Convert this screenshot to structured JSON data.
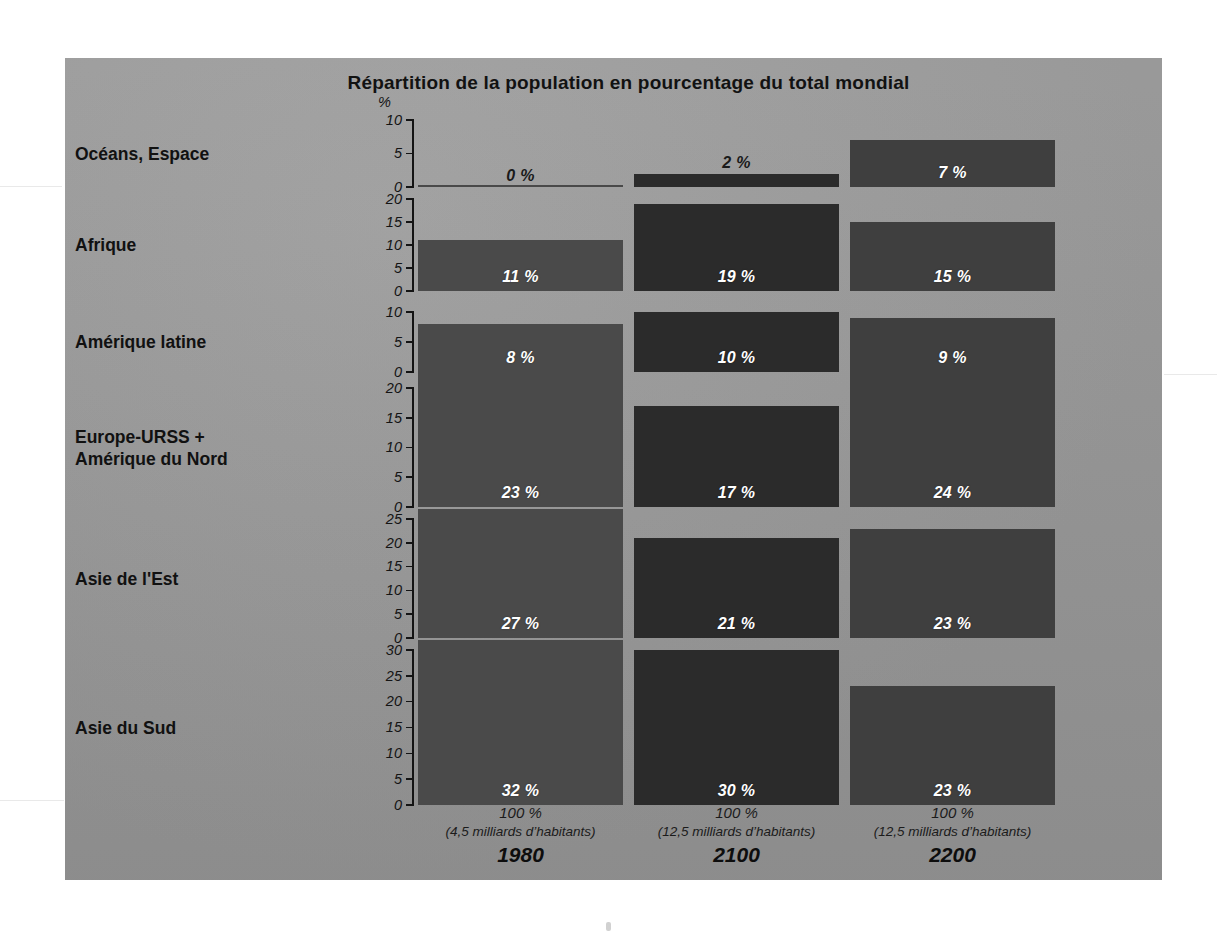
{
  "figure": {
    "title": "Répartition de la population en pourcentage du total mondial",
    "percent_symbol": "%",
    "background_color": "#9a9a9a",
    "label_color": "#ffffff"
  },
  "columns": [
    {
      "year": "1980",
      "total_pct": "100 %",
      "total_people": "(4,5 milliards d’habitants)",
      "color": "#4a4a4a"
    },
    {
      "year": "2100",
      "total_pct": "100 %",
      "total_people": "(12,5 milliards d’habitants)",
      "color": "#2b2b2b"
    },
    {
      "year": "2200",
      "total_pct": "100 %",
      "total_people": "(12,5 milliards d’habitants)",
      "color": "#3f3f3f"
    }
  ],
  "rows": [
    {
      "label": "Océans, Espace",
      "ymax": 10,
      "ticks": [
        "10",
        "5",
        "0"
      ],
      "values": [
        "0 %",
        "2 %",
        "7 %"
      ],
      "numbers": [
        0,
        2,
        7
      ]
    },
    {
      "label": "Afrique",
      "ymax": 20,
      "ticks": [
        "20",
        "15",
        "10",
        "5",
        "0"
      ],
      "values": [
        "11 %",
        "19 %",
        "15 %"
      ],
      "numbers": [
        11,
        19,
        15
      ]
    },
    {
      "label": "Amérique latine",
      "ymax": 10,
      "ticks": [
        "10",
        "5",
        "0"
      ],
      "values": [
        "8 %",
        "10 %",
        "9 %"
      ],
      "numbers": [
        8,
        10,
        9
      ]
    },
    {
      "label": "Europe-URSS +\nAmérique du Nord",
      "ymax": 20,
      "ticks": [
        "20",
        "15",
        "10",
        "5",
        "0"
      ],
      "values": [
        "23 %",
        "17 %",
        "24 %"
      ],
      "numbers": [
        23,
        17,
        24
      ]
    },
    {
      "label": "Asie de l'Est",
      "ymax": 25,
      "ticks": [
        "25",
        "20",
        "15",
        "10",
        "5",
        "0"
      ],
      "values": [
        "27 %",
        "21 %",
        "23 %"
      ],
      "numbers": [
        27,
        21,
        23
      ]
    },
    {
      "label": "Asie du Sud",
      "ymax": 30,
      "ticks": [
        "30",
        "25",
        "20",
        "15",
        "10",
        "5",
        "0"
      ],
      "values": [
        "32 %",
        "30 %",
        "23 %"
      ],
      "numbers": [
        32,
        30,
        23
      ]
    }
  ],
  "chart_data": {
    "type": "bar",
    "title": "Répartition de la population en pourcentage du total mondial",
    "xlabel": "",
    "ylabel": "%",
    "categories": [
      "1980",
      "2100",
      "2200"
    ],
    "grid": false,
    "legend": "none",
    "orientation": "vertical",
    "panels": [
      {
        "name": "Océans, Espace",
        "ylim": [
          0,
          10
        ],
        "yticks": [
          0,
          5,
          10
        ],
        "values": [
          0,
          2,
          7
        ],
        "data_labels": [
          "0 %",
          "2 %",
          "7 %"
        ]
      },
      {
        "name": "Afrique",
        "ylim": [
          0,
          20
        ],
        "yticks": [
          0,
          5,
          10,
          15,
          20
        ],
        "values": [
          11,
          19,
          15
        ],
        "data_labels": [
          "11 %",
          "19 %",
          "15 %"
        ]
      },
      {
        "name": "Amérique latine",
        "ylim": [
          0,
          10
        ],
        "yticks": [
          0,
          5,
          10
        ],
        "values": [
          8,
          10,
          9
        ],
        "data_labels": [
          "8 %",
          "10 %",
          "9 %"
        ]
      },
      {
        "name": "Europe-URSS + Amérique du Nord",
        "ylim": [
          0,
          20
        ],
        "yticks": [
          0,
          5,
          10,
          15,
          20
        ],
        "values": [
          23,
          17,
          24
        ],
        "data_labels": [
          "23 %",
          "17 %",
          "24 %"
        ]
      },
      {
        "name": "Asie de l'Est",
        "ylim": [
          0,
          25
        ],
        "yticks": [
          0,
          5,
          10,
          15,
          20,
          25
        ],
        "values": [
          27,
          21,
          23
        ],
        "data_labels": [
          "27 %",
          "21 %",
          "23 %"
        ]
      },
      {
        "name": "Asie du Sud",
        "ylim": [
          0,
          30
        ],
        "yticks": [
          0,
          5,
          10,
          15,
          20,
          25,
          30
        ],
        "values": [
          32,
          30,
          23
        ],
        "data_labels": [
          "32 %",
          "30 %",
          "23 %"
        ]
      }
    ],
    "column_annotations": [
      {
        "year": "1980",
        "total": "100 %",
        "population": "(4,5 milliards d’habitants)"
      },
      {
        "year": "2100",
        "total": "100 %",
        "population": "(12,5 milliards d’habitants)"
      },
      {
        "year": "2200",
        "total": "100 %",
        "population": "(12,5 milliards d’habitants)"
      }
    ]
  }
}
